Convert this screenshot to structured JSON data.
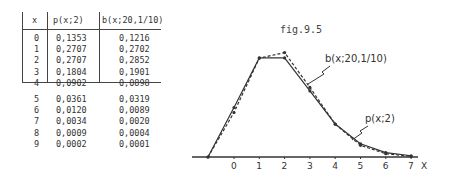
{
  "table": {
    "headers": [
      "x",
      "p(x;2)",
      "b(x;20,1/10)"
    ],
    "rows": [
      [
        "0",
        "0,1353",
        "0,1216"
      ],
      [
        "1",
        "0,2707",
        "0,2702"
      ],
      [
        "2",
        "0,2707",
        "0,2852"
      ],
      [
        "3",
        "0,1804",
        "0,1901"
      ],
      [
        "4",
        "0,0902",
        "0,0898"
      ],
      [
        "5",
        "0,0361",
        "0,0319"
      ],
      [
        "6",
        "0,0120",
        "0,0089"
      ],
      [
        "7",
        "0,0034",
        "0,0020"
      ],
      [
        "8",
        "0,0009",
        "0,0004"
      ],
      [
        "9",
        "0,0002",
        "0,0001"
      ]
    ]
  },
  "figure": {
    "title": "fig.9.5",
    "x_axis_label": "X",
    "x_ticks": [
      "0",
      "1",
      "2",
      "3",
      "4",
      "5",
      "6",
      "7"
    ],
    "series_labels": {
      "binomial": "b(x;20,1/10)",
      "poisson": "p(x;2)"
    }
  },
  "chart_data": {
    "type": "line",
    "title": "fig.9.5",
    "xlabel": "X",
    "ylabel": "",
    "x": [
      0,
      1,
      2,
      3,
      4,
      5,
      6,
      7
    ],
    "series": [
      {
        "name": "p(x;2)",
        "style": "solid",
        "values": [
          0.1353,
          0.2707,
          0.2707,
          0.1804,
          0.0902,
          0.0361,
          0.012,
          0.0034
        ]
      },
      {
        "name": "b(x;20,1/10)",
        "style": "dashed",
        "values": [
          0.1216,
          0.2702,
          0.2852,
          0.1901,
          0.0898,
          0.0319,
          0.0089,
          0.002
        ]
      }
    ],
    "grid": false,
    "legend_position": "inline annotations"
  }
}
